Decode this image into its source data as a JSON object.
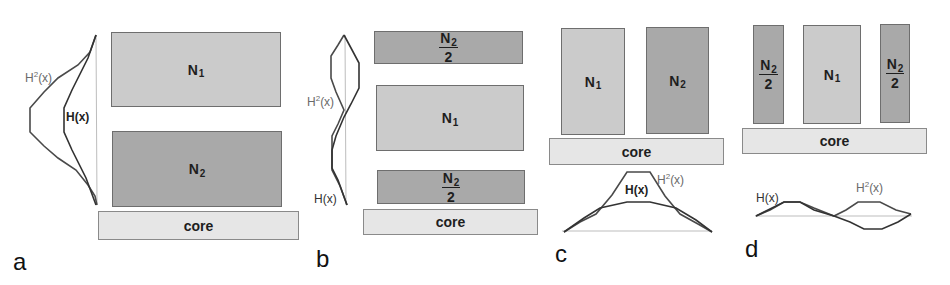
{
  "figure": {
    "panels": [
      {
        "letter": "a",
        "blocks": [
          {
            "label": "N",
            "sub": "1",
            "role": "N1"
          },
          {
            "label": "N",
            "sub": "2",
            "role": "N2"
          },
          {
            "label": "core",
            "role": "core"
          }
        ],
        "curve_labels": {
          "h2": "H",
          "h2_sup": "2",
          "h2_arg": "(x)",
          "h": "H(x)"
        }
      },
      {
        "letter": "b",
        "blocks": [
          {
            "label": "N",
            "sub": "2",
            "den": "2",
            "role": "N2/2 top"
          },
          {
            "label": "N",
            "sub": "1",
            "role": "N1"
          },
          {
            "label": "N",
            "sub": "2",
            "den": "2",
            "role": "N2/2 bottom"
          },
          {
            "label": "core",
            "role": "core"
          }
        ],
        "curve_labels": {
          "h2": "H",
          "h2_sup": "2",
          "h2_arg": "(x)",
          "h": "H(x)"
        }
      },
      {
        "letter": "c",
        "blocks": [
          {
            "label": "N",
            "sub": "1",
            "role": "N1"
          },
          {
            "label": "N",
            "sub": "2",
            "role": "N2"
          },
          {
            "label": "core",
            "role": "core"
          }
        ],
        "curve_labels": {
          "h2": "H",
          "h2_sup": "2",
          "h2_arg": "(x)",
          "h": "H(x)"
        }
      },
      {
        "letter": "d",
        "blocks": [
          {
            "label": "N",
            "sub": "2",
            "den": "2",
            "role": "N2/2 left"
          },
          {
            "label": "N",
            "sub": "1",
            "role": "N1"
          },
          {
            "label": "N",
            "sub": "2",
            "den": "2",
            "role": "N2/2 right"
          },
          {
            "label": "core",
            "role": "core"
          }
        ],
        "curve_labels": {
          "h2": "H",
          "h2_sup": "2",
          "h2_arg": "(x)",
          "h": "H(x)"
        }
      }
    ],
    "colors": {
      "n1_fill": "#cbcbcb",
      "n2_fill": "#a9a9a9",
      "core_fill": "#e6e6e6",
      "h_curve": "#3a3a3a",
      "h2_curve": "#4a4a4a",
      "axis": "#bdbdbd"
    }
  }
}
